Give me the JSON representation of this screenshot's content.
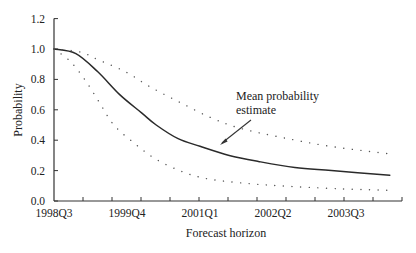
{
  "chart_data": {
    "type": "line",
    "title": "",
    "xlabel": "Forecast horizon",
    "ylabel": "Probability",
    "ylim": [
      0,
      1.2
    ],
    "yticks": [
      "0.0",
      "0.2",
      "0.4",
      "0.6",
      "0.8",
      "1.0",
      "1.2"
    ],
    "xtick_labels": [
      "1998Q3",
      "1999Q4",
      "2001Q1",
      "2002Q2",
      "2003Q3"
    ],
    "grid": false,
    "legend": null,
    "annotations": [
      {
        "text_lines": [
          "Mean probability",
          "estimate"
        ],
        "points_to": "mean-probability-estimate"
      }
    ],
    "x_quarters_from_1998Q3": [
      0,
      1.5,
      3,
      4.5,
      6,
      7,
      8.5,
      10,
      12,
      14,
      16.5,
      19,
      23
    ],
    "series": [
      {
        "name": "Mean probability estimate",
        "style": "solid",
        "x": [
          0,
          1.5,
          3,
          4.5,
          6,
          7,
          8.5,
          10,
          12,
          14,
          16.5,
          19,
          23
        ],
        "values": [
          1.0,
          0.97,
          0.85,
          0.7,
          0.58,
          0.5,
          0.41,
          0.36,
          0.3,
          0.26,
          0.22,
          0.2,
          0.17
        ]
      },
      {
        "name": "Upper band",
        "style": "dotted",
        "x": [
          0,
          1.8,
          3,
          4.9,
          6.6,
          8.6,
          10.7,
          12.7,
          15.5,
          18.9,
          23
        ],
        "values": [
          1.0,
          0.98,
          0.93,
          0.85,
          0.75,
          0.65,
          0.55,
          0.48,
          0.42,
          0.36,
          0.31
        ]
      },
      {
        "name": "Lower band",
        "style": "dotted",
        "x": [
          0,
          1.1,
          2.1,
          3.1,
          4.1,
          5.5,
          6.9,
          8.6,
          10.3,
          12.7,
          15.5,
          19.6,
          23
        ],
        "values": [
          1.0,
          0.92,
          0.8,
          0.65,
          0.5,
          0.38,
          0.28,
          0.2,
          0.15,
          0.12,
          0.1,
          0.08,
          0.07
        ]
      }
    ]
  }
}
